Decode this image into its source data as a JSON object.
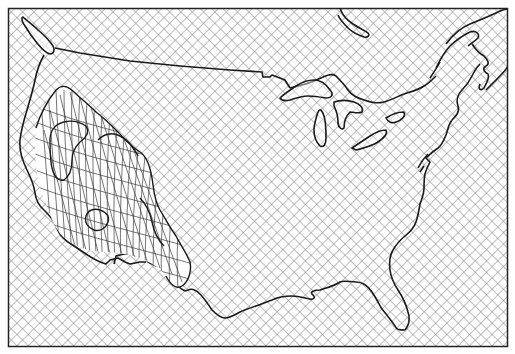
{
  "map": {
    "subject": "Contiguous United States with surrounding land hatched and a 3D wireframe surface over the western region",
    "frame": {
      "x": 8,
      "y": 8,
      "width": 500,
      "height": 339
    },
    "colors": {
      "background": "#ffffff",
      "hatch": "#8a8a8a",
      "outline": "#1a1a1a",
      "mesh": "#3a3a3a",
      "frame": "#222222"
    },
    "hatch": {
      "spacing": 8,
      "angle_deg": 45
    },
    "features": [
      {
        "name": "us-outline",
        "kind": "coastline-and-border"
      },
      {
        "name": "great-lakes",
        "kind": "lakes"
      },
      {
        "name": "hudson-bay-lower",
        "kind": "water"
      },
      {
        "name": "st-lawrence",
        "kind": "water"
      },
      {
        "name": "vancouver-island",
        "kind": "island"
      },
      {
        "name": "western-mesh-surface",
        "kind": "3d-wireframe"
      }
    ]
  }
}
